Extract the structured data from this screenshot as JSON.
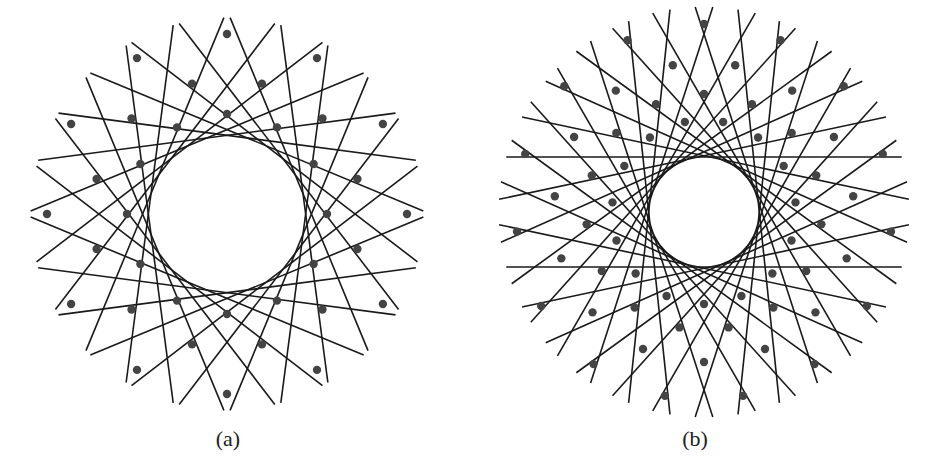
{
  "figure": {
    "panels": [
      {
        "label": "(a)",
        "symmetry": 12,
        "center": [
          227,
          214
        ],
        "outer_radius": 180,
        "inner_void_radius": 78,
        "vertex_rings": [
          180,
          135,
          100
        ],
        "line_color": "#1a1a1a",
        "vertex_color": "#444444"
      },
      {
        "label": "(b)",
        "symmetry": 15,
        "center": [
          704,
          212
        ],
        "outer_radius": 188,
        "inner_void_radius": 55,
        "vertex_rings": [
          188,
          150,
          118,
          92
        ],
        "line_color": "#1a1a1a",
        "vertex_color": "#444444"
      }
    ]
  }
}
